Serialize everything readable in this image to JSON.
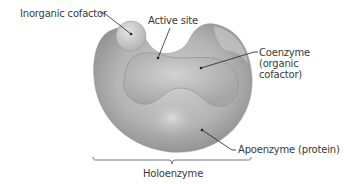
{
  "diagram": {
    "labels": {
      "inorganic_cofactor": "Inorganic cofactor",
      "active_site": "Active site",
      "coenzyme_line1": "Coenzyme",
      "coenzyme_line2": "(organic",
      "coenzyme_line3": "cofactor)",
      "apoenzyme": "Apoenzyme (protein)",
      "holoenzyme": "Holoenzyme"
    },
    "colors": {
      "background": "#ffffff",
      "protein_light": "#d6d6d6",
      "protein_dark": "#8a8a8a",
      "text": "#3a3a3a",
      "leader_line": "#222222"
    }
  }
}
